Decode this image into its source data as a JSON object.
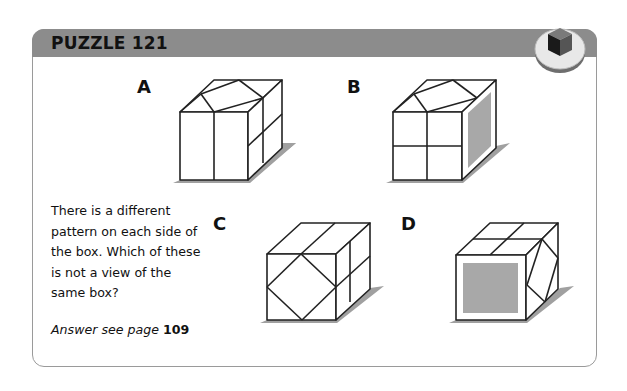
{
  "header": {
    "title": "PUZZLE 121",
    "badge_icon": "cube-icon",
    "colors": {
      "header_bg": "#8c8c8c",
      "panel_border": "#9a9a9a",
      "shade": "#a8a8a8",
      "shadow": "#a0a0a0"
    }
  },
  "options": [
    {
      "label": "A"
    },
    {
      "label": "B"
    },
    {
      "label": "C"
    },
    {
      "label": "D"
    }
  ],
  "question": {
    "text": "There is a different pattern on each side of the box. Which of these is not a view of the same box?"
  },
  "answer": {
    "prefix": "Answer see page",
    "page": "109"
  }
}
